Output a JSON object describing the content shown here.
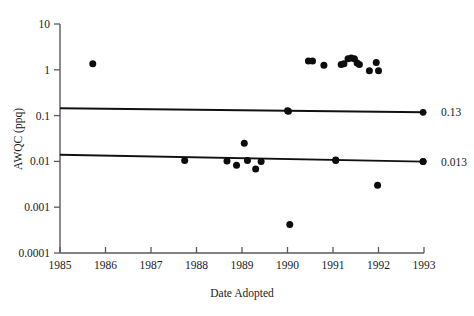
{
  "chart_data": {
    "type": "scatter",
    "title": "",
    "xlabel": "Date Adopted",
    "ylabel": "AWQC (ppq)",
    "yscale": "log",
    "xlim": [
      1985,
      1993
    ],
    "ylim": [
      0.0001,
      10
    ],
    "grid": false,
    "legend": null,
    "xticks": [
      1985,
      1986,
      1987,
      1988,
      1989,
      1990,
      1991,
      1992,
      1993
    ],
    "xticklabels": [
      "1985",
      "1986",
      "1987",
      "1988",
      "1989",
      "1990",
      "1991",
      "1992",
      "1993"
    ],
    "yticks": [
      0.0001,
      0.001,
      0.01,
      0.1,
      1,
      10
    ],
    "yticklabels": [
      "0.0001",
      "0.001",
      "0.01",
      "0.1",
      "1",
      "10"
    ],
    "points": [
      {
        "x": 1985.72,
        "y": 1.35
      },
      {
        "x": 1987.74,
        "y": 0.0105
      },
      {
        "x": 1988.67,
        "y": 0.0102
      },
      {
        "x": 1988.88,
        "y": 0.0082
      },
      {
        "x": 1989.05,
        "y": 0.025
      },
      {
        "x": 1989.12,
        "y": 0.0105
      },
      {
        "x": 1989.3,
        "y": 0.0068
      },
      {
        "x": 1989.42,
        "y": 0.01
      },
      {
        "x": 1990.02,
        "y": 0.125
      },
      {
        "x": 1990.05,
        "y": 0.00042
      },
      {
        "x": 1990.46,
        "y": 1.55
      },
      {
        "x": 1990.55,
        "y": 1.55
      },
      {
        "x": 1990.8,
        "y": 1.25
      },
      {
        "x": 1991.06,
        "y": 0.0105
      },
      {
        "x": 1991.18,
        "y": 1.3
      },
      {
        "x": 1991.24,
        "y": 1.35
      },
      {
        "x": 1991.33,
        "y": 1.75
      },
      {
        "x": 1991.4,
        "y": 1.8
      },
      {
        "x": 1991.47,
        "y": 1.75
      },
      {
        "x": 1991.53,
        "y": 1.4
      },
      {
        "x": 1991.58,
        "y": 1.3
      },
      {
        "x": 1991.8,
        "y": 0.95
      },
      {
        "x": 1991.95,
        "y": 1.45
      },
      {
        "x": 1991.98,
        "y": 0.003
      },
      {
        "x": 1992.0,
        "y": 0.95
      },
      {
        "x": 1992.98,
        "y": 0.01
      }
    ],
    "trendlines": [
      {
        "label": "0.13",
        "x0": 1985,
        "y0": 0.145,
        "x1": 1993,
        "y1": 0.118,
        "marker_x": 1990.0,
        "marker_x2": 1992.98
      },
      {
        "label": "0.013",
        "x0": 1985,
        "y0": 0.014,
        "x1": 1993,
        "y1": 0.0099,
        "marker_x": 1991.06,
        "marker_x2": 1992.98
      }
    ],
    "endpoint_labels": [
      "0.13",
      "0.013"
    ],
    "colors": {
      "point": "#0d0d0d",
      "line": "#111111",
      "axis": "#5a5a5a",
      "text": "#1a1a1a",
      "background": "#ffffff"
    }
  }
}
